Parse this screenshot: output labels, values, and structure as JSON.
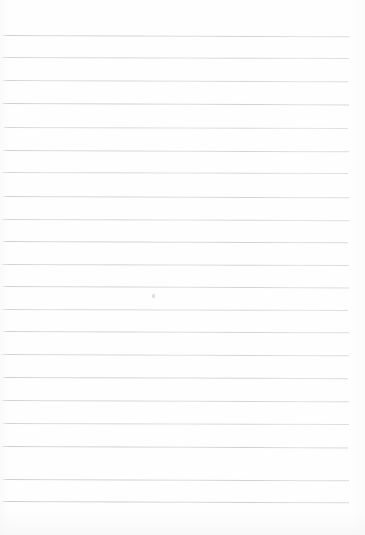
{
  "document": {
    "type": "lined-paper-scan",
    "title": "Blank ruled notebook page",
    "page_width": 365,
    "page_height": 535,
    "background_color": "#ffffff",
    "sheet_color": "#fefefe",
    "text_content": "",
    "handwriting_present": false
  },
  "ruling": {
    "line_color": "#c9cbd0",
    "line_thickness_px": 1,
    "line_count": 21,
    "first_line_y": 35,
    "line_spacing_px": 22.3,
    "left_margin_x": 3,
    "right_end_x": 349,
    "top_margin_px": 35,
    "bottom_margin_px": 34,
    "has_vertical_margin_rule": false,
    "lines": [
      {
        "y": 35,
        "x1": 3,
        "x2": 349,
        "tilt": 0.22,
        "opacity": 0.78
      },
      {
        "y": 57,
        "x1": 2,
        "x2": 349,
        "tilt": 0.18,
        "opacity": 0.72
      },
      {
        "y": 80,
        "x1": 3,
        "x2": 348,
        "tilt": 0.2,
        "opacity": 0.7
      },
      {
        "y": 103,
        "x1": 2,
        "x2": 349,
        "tilt": 0.24,
        "opacity": 0.8
      },
      {
        "y": 127,
        "x1": 4,
        "x2": 348,
        "tilt": 0.16,
        "opacity": 0.66
      },
      {
        "y": 150,
        "x1": 3,
        "x2": 349,
        "tilt": 0.2,
        "opacity": 0.74
      },
      {
        "y": 172,
        "x1": 2,
        "x2": 348,
        "tilt": 0.18,
        "opacity": 0.68
      },
      {
        "y": 196,
        "x1": 3,
        "x2": 349,
        "tilt": 0.22,
        "opacity": 0.76
      },
      {
        "y": 219,
        "x1": 2,
        "x2": 349,
        "tilt": 0.19,
        "opacity": 0.71
      },
      {
        "y": 241,
        "x1": 3,
        "x2": 348,
        "tilt": 0.21,
        "opacity": 0.79
      },
      {
        "y": 264,
        "x1": 2,
        "x2": 349,
        "tilt": 0.17,
        "opacity": 0.73
      },
      {
        "y": 286,
        "x1": 3,
        "x2": 349,
        "tilt": 0.23,
        "opacity": 0.77
      },
      {
        "y": 309,
        "x1": 2,
        "x2": 348,
        "tilt": 0.18,
        "opacity": 0.69
      },
      {
        "y": 331,
        "x1": 3,
        "x2": 349,
        "tilt": 0.2,
        "opacity": 0.75
      },
      {
        "y": 354,
        "x1": 2,
        "x2": 349,
        "tilt": 0.22,
        "opacity": 0.72
      },
      {
        "y": 377,
        "x1": 3,
        "x2": 348,
        "tilt": 0.19,
        "opacity": 0.78
      },
      {
        "y": 400,
        "x1": 2,
        "x2": 349,
        "tilt": 0.21,
        "opacity": 0.74
      },
      {
        "y": 423,
        "x1": 3,
        "x2": 349,
        "tilt": 0.18,
        "opacity": 0.7
      },
      {
        "y": 446,
        "x1": 2,
        "x2": 348,
        "tilt": 0.24,
        "opacity": 0.82
      },
      {
        "y": 479,
        "x1": 3,
        "x2": 349,
        "tilt": 0.2,
        "opacity": 0.8
      },
      {
        "y": 501,
        "x1": 2,
        "x2": 349,
        "tilt": 0.22,
        "opacity": 0.84
      }
    ]
  },
  "artifacts": {
    "specks": [
      {
        "name": "ink-speck",
        "x": 152,
        "y": 294,
        "w": 3,
        "h": 4,
        "opacity": 0.55
      }
    ]
  }
}
